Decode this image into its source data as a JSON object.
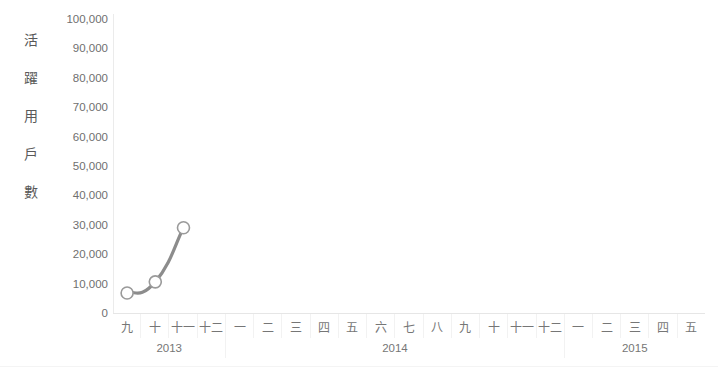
{
  "chart_data": {
    "type": "line",
    "title": "",
    "subtitle": "",
    "xlabel": "",
    "ylabel": "活躍用戶數",
    "ylabel_chars": [
      "活",
      "躍",
      "用",
      "戶",
      "數"
    ],
    "ylim": [
      0,
      100000
    ],
    "ytick_labels": [
      "100,000",
      "90,000",
      "80,000",
      "70,000",
      "60,000",
      "50,000",
      "40,000",
      "30,000",
      "20,000",
      "10,000",
      "0"
    ],
    "ytick_values": [
      100000,
      90000,
      80000,
      70000,
      60000,
      50000,
      40000,
      30000,
      20000,
      10000,
      0
    ],
    "grid": false,
    "legend": false,
    "legend_position": "none",
    "categories": [
      "九",
      "十",
      "十一",
      "十二",
      "一",
      "二",
      "三",
      "四",
      "五",
      "六",
      "七",
      "八",
      "九",
      "十",
      "十一",
      "十二",
      "一",
      "二",
      "三",
      "四",
      "五"
    ],
    "year_groups": [
      {
        "label": "2013",
        "span": 4
      },
      {
        "label": "2014",
        "span": 12
      },
      {
        "label": "2015",
        "span": 5
      }
    ],
    "series": [
      {
        "name": "活躍用戶數",
        "color": "#8c8c8c",
        "marker": "open-circle",
        "values": [
          6800,
          10600,
          29000,
          null,
          null,
          null,
          null,
          null,
          null,
          null,
          null,
          null,
          null,
          null,
          null,
          null,
          null,
          null,
          null,
          null,
          null
        ]
      }
    ],
    "points": [
      {
        "category": "十",
        "year": "2013",
        "value": 6800
      },
      {
        "category": "十二",
        "year": "2013",
        "value": 10600
      },
      {
        "category": "二",
        "year": "2014",
        "value": 29000
      }
    ],
    "colors": {
      "line": "#8c8c8c",
      "marker_fill": "#ffffff",
      "marker_stroke": "#9a9a9a",
      "axis": "#e6e6e6",
      "text": "#6f6f6f"
    }
  }
}
